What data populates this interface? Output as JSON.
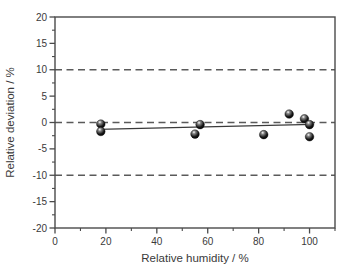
{
  "figure": {
    "background": "#ffffff",
    "axis_color": "#4a4a4a",
    "text_color": "#3a3a3a",
    "dashed_line_color": "#5a5a5a",
    "fit_line_color": "#3a3a3a",
    "marker_color": "#000000",
    "marker_highlight": "#ffffff"
  },
  "chart_data": {
    "type": "scatter",
    "title": "",
    "xlabel": "Relative humidity / %",
    "ylabel": "Relative deviation / %",
    "xlim": [
      0,
      110
    ],
    "ylim": [
      -20,
      20
    ],
    "x_major_ticks": [
      0,
      20,
      40,
      60,
      80,
      100
    ],
    "x_minor_ticks": [
      10,
      30,
      50,
      70,
      90,
      110
    ],
    "y_major_ticks": [
      -20,
      -15,
      -10,
      -5,
      0,
      5,
      10,
      15,
      20
    ],
    "y_minor_ticks": [
      -17.5,
      -12.5,
      -7.5,
      -2.5,
      2.5,
      7.5,
      12.5,
      17.5
    ],
    "reference_lines_y": [
      10,
      0,
      -10
    ],
    "grid": false,
    "legend": "none",
    "series": [
      {
        "name": "measured-deviation-points",
        "marker": "sphere",
        "points": [
          [
            18,
            -0.3
          ],
          [
            18,
            -1.7
          ],
          [
            55,
            -2.2
          ],
          [
            57,
            -0.4
          ],
          [
            82,
            -2.3
          ],
          [
            92,
            1.6
          ],
          [
            98,
            0.7
          ],
          [
            100,
            -0.4
          ],
          [
            100,
            -2.7
          ]
        ]
      }
    ],
    "fit_line": {
      "x1": 17,
      "y1": -1.3,
      "x2": 101,
      "y2": -0.35
    }
  }
}
